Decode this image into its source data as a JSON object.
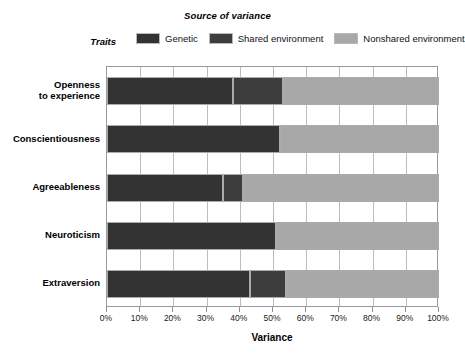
{
  "chart_data": {
    "type": "bar",
    "orientation": "horizontal",
    "stacked": true,
    "title": "Source of variance",
    "xlabel": "Variance",
    "ylabel": "Traits",
    "xlim": [
      0,
      100
    ],
    "grid": true,
    "legend_position": "top",
    "categories": [
      "Openness to experience",
      "Conscientiousness",
      "Agreeableness",
      "Neuroticism",
      "Extraversion"
    ],
    "series": [
      {
        "name": "Genetic",
        "color": "#333333",
        "values": [
          38,
          52,
          35,
          51,
          43
        ]
      },
      {
        "name": "Shared environment",
        "color": "#3d3d3d",
        "values": [
          15,
          0,
          6,
          0,
          11
        ]
      },
      {
        "name": "Nonshared environment",
        "color": "#a8a8a8",
        "values": [
          47,
          48,
          59,
          49,
          46
        ]
      }
    ],
    "xticks": [
      "0%",
      "10%",
      "20%",
      "30%",
      "40%",
      "50%",
      "60%",
      "70%",
      "80%",
      "90%",
      "100%"
    ],
    "xtick_values": [
      0,
      10,
      20,
      30,
      40,
      50,
      60,
      70,
      80,
      90,
      100
    ]
  },
  "legend": {
    "title": "Source of variance",
    "traits_label": "Traits",
    "items": [
      {
        "label": "Genetic",
        "color": "#333333"
      },
      {
        "label": "Shared environment",
        "color": "#3d3d3d"
      },
      {
        "label": "Nonshared environment",
        "color": "#a8a8a8"
      }
    ]
  },
  "axes": {
    "x_title": "Variance",
    "y_title": "Traits"
  },
  "categories_display": [
    [
      "Openness",
      "to experience"
    ],
    [
      "Conscientiousness"
    ],
    [
      "Agreeableness"
    ],
    [
      "Neuroticism"
    ],
    [
      "Extraversion"
    ]
  ],
  "colors": {
    "plot_border": "#9a9a9a",
    "gridline": "#bdbdbd",
    "bar_border": "#ababab",
    "background": "#ffffff",
    "text": "#000000"
  }
}
